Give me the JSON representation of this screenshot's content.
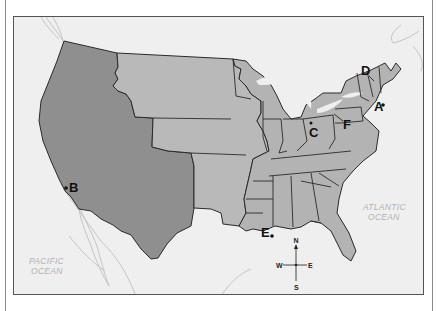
{
  "map": {
    "type": "historical-us-territorial-map",
    "colors": {
      "water": "#efefef",
      "western_cession": "#8f8f8f",
      "middle_purchase": "#b9b9b9",
      "eastern_states": "#b3b3b3",
      "borders": "#2a2a2a",
      "coastline_foreign": "#c8c8c8"
    },
    "regions": [
      {
        "id": "west",
        "label": "Western territories (Mexican Cession, Texas, Oregon)"
      },
      {
        "id": "middle",
        "label": "Louisiana Purchase territory"
      },
      {
        "id": "east",
        "label": "Eastern states"
      }
    ],
    "point_labels": [
      {
        "letter": "A",
        "description": "point near Massachusetts coast"
      },
      {
        "letter": "B",
        "description": "point on southern California coast"
      },
      {
        "letter": "C",
        "description": "point in Ohio/Indiana area"
      },
      {
        "letter": "D",
        "description": "pointer to northern New York"
      },
      {
        "letter": "E",
        "description": "point near Louisiana coast"
      },
      {
        "letter": "F",
        "description": "pointer to Lake Erie / Pennsylvania"
      }
    ],
    "oceans": [
      {
        "line1": "PACIFIC",
        "line2": "OCEAN"
      },
      {
        "line1": "ATLANTIC",
        "line2": "OCEAN"
      }
    ],
    "compass": {
      "n": "N",
      "s": "S",
      "e": "E",
      "w": "W"
    }
  }
}
